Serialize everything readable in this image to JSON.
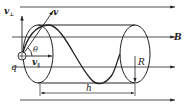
{
  "diagram": {
    "labels": {
      "v_perp": "v",
      "v_perp_sub": "⊥",
      "v": "v",
      "theta": "θ",
      "v_par": "v",
      "v_par_sub": "∥",
      "q": "q",
      "B": "B",
      "R": "R",
      "h": "h"
    },
    "colors": {
      "stroke": "#222222",
      "background": "#ffffff"
    }
  }
}
